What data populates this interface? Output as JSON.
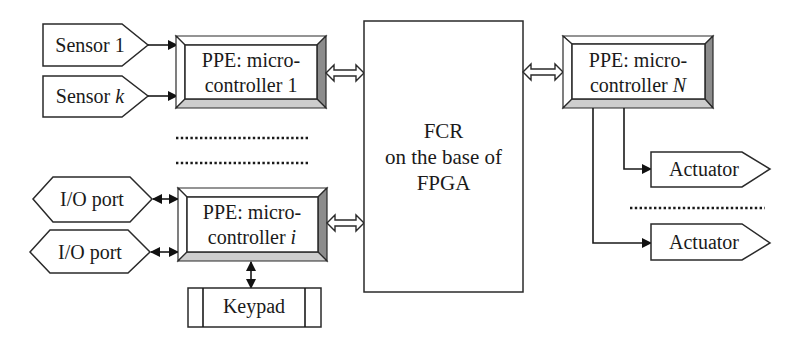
{
  "diagram": {
    "sensors": [
      {
        "text": "Sensor ",
        "var": "1"
      },
      {
        "text": "Sensor ",
        "var": "k"
      }
    ],
    "io_ports": [
      {
        "label": "I/O port"
      },
      {
        "label": "I/O port"
      }
    ],
    "ppe_blocks": [
      {
        "line1": "PPE: micro-",
        "line2": "controller ",
        "var": "1"
      },
      {
        "line1": "PPE: micro-",
        "line2": "controller ",
        "var": "i"
      },
      {
        "line1": "PPE: micro-",
        "line2": "controller ",
        "var": "N"
      }
    ],
    "fcr": {
      "lines": [
        "FCR",
        "on the base of",
        "FPGA"
      ]
    },
    "keypad": {
      "label": "Keypad"
    },
    "actuators": [
      {
        "label": "Actuator"
      },
      {
        "label": "Actuator"
      }
    ]
  },
  "colors": {
    "background": "#ffffff",
    "stroke": "#2a2a2a",
    "bevel_light": "#ffffff",
    "bevel_right": "#8c8c8c",
    "bevel_bottom": "#cdcdcd"
  }
}
